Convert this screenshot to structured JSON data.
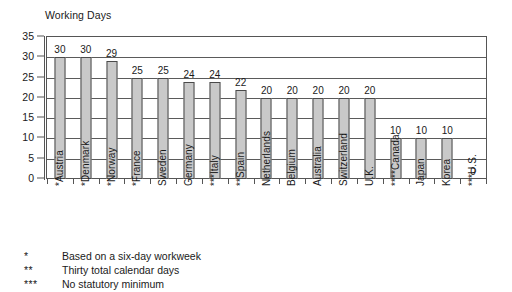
{
  "chart_data": {
    "type": "bar",
    "title": "Working Days",
    "xlabel": "",
    "ylabel": "",
    "ylim": [
      0,
      35
    ],
    "yticks": [
      0,
      5,
      10,
      15,
      20,
      25,
      30,
      35
    ],
    "ytick_labels": [
      "0",
      "5",
      "10",
      "15",
      "20",
      "25",
      "30",
      "35"
    ],
    "grid": true,
    "legend": "none",
    "categories": [
      "*Austria",
      "*Denmark",
      "*Norway",
      "*France",
      "Sweden",
      "Germany",
      "***Italy",
      "**Spain",
      "Netherlands",
      "Belgium",
      "Australia",
      "Switzerland",
      "U.K.",
      "****Canada",
      "Japan",
      "Korea",
      "***U.S."
    ],
    "values": [
      30,
      30,
      29,
      25,
      25,
      24,
      24,
      22,
      20,
      20,
      20,
      20,
      20,
      10,
      10,
      10,
      0
    ],
    "value_labels": [
      "30",
      "30",
      "29",
      "25",
      "25",
      "24",
      "24",
      "22",
      "20",
      "20",
      "20",
      "20",
      "20",
      "10",
      "10",
      "10",
      "0"
    ],
    "bar_fill_color": "#c9c9c9",
    "bar_edge_color": "#4a4a4a",
    "axis_color": "#555555",
    "text_color": "#1a1a1a"
  },
  "footnotes": [
    {
      "marker": "*",
      "text": "Based on a six-day workweek"
    },
    {
      "marker": "**",
      "text": "Thirty total calendar days"
    },
    {
      "marker": "***",
      "text": "No statutory minimum"
    }
  ]
}
